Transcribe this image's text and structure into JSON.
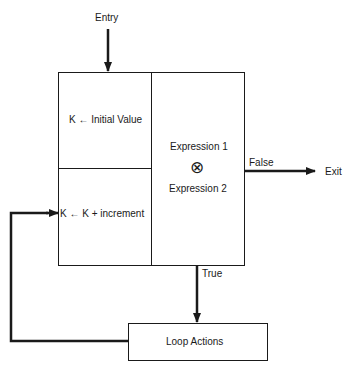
{
  "diagram": {
    "type": "flowchart",
    "entry_label": "Entry",
    "init_label": "K ← Initial Value",
    "increment_label": "K ← K + increment",
    "condition": {
      "expr1": "Expression 1",
      "operator_symbol": "⊗",
      "expr2": "Expression 2"
    },
    "false_label": "False",
    "exit_label": "Exit",
    "true_label": "True",
    "loop_actions_label": "Loop Actions",
    "colors": {
      "line": "#1a1a1a",
      "background": "#ffffff"
    }
  }
}
